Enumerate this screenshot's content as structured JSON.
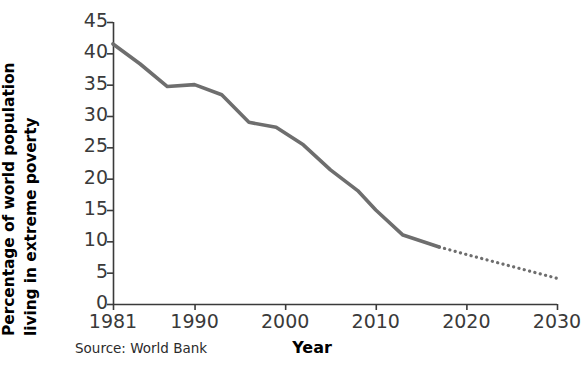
{
  "chart_data": {
    "type": "line",
    "title": "",
    "xlabel": "Year",
    "ylabel": "Percentage of world population living in extreme poverty",
    "ylabel_lines": [
      "Percentage of world population",
      "living in extreme poverty"
    ],
    "source": "Source: World Bank",
    "xlim": [
      1981,
      2030
    ],
    "ylim": [
      0,
      45
    ],
    "xticks": [
      1981,
      1990,
      2000,
      2010,
      2020,
      2030
    ],
    "xtick_labels": [
      "1981",
      "1990",
      "2000",
      "2010",
      "2020",
      "2030"
    ],
    "yticks": [
      0,
      5,
      10,
      15,
      20,
      25,
      30,
      35,
      40,
      45
    ],
    "ytick_labels": [
      "0",
      "5",
      "10",
      "15",
      "20",
      "25",
      "30",
      "35",
      "40",
      "45"
    ],
    "grid": false,
    "legend": "none",
    "line_color": "#6e6e6e",
    "axis_color": "#3a3a3a",
    "series": [
      {
        "name": "Historical (observed)",
        "style": "solid",
        "x": [
          1981,
          1984,
          1987,
          1990,
          1993,
          1996,
          1999,
          2002,
          2005,
          2008,
          2010,
          2013,
          2017
        ],
        "values": [
          41.5,
          38.3,
          34.7,
          35.0,
          33.4,
          29.0,
          28.2,
          25.4,
          21.4,
          18.1,
          15.0,
          11.0,
          9.1
        ]
      },
      {
        "name": "Projection",
        "style": "dotted",
        "x": [
          2017,
          2020,
          2025,
          2030
        ],
        "values": [
          9.1,
          7.9,
          6.0,
          4.1
        ]
      }
    ]
  },
  "axes_geometry": {
    "plot_left_px": 113,
    "plot_right_px": 557,
    "plot_top_px": 22,
    "plot_bottom_px": 304
  }
}
